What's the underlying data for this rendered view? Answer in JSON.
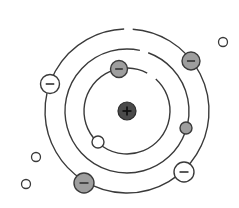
{
  "diagram": {
    "nucleus": {
      "sign": "+",
      "label": "nucleus",
      "color": "#4a4a4a"
    },
    "colors": {
      "stroke": "#3a3a3a",
      "electron_gray": "#9e9e9e",
      "electron_white": "#ffffff",
      "background": "#ffffff"
    },
    "orbits": [
      {
        "name": "inner-orbit",
        "level": 1
      },
      {
        "name": "middle-orbit",
        "level": 2
      },
      {
        "name": "outer-orbit",
        "level": 3
      }
    ],
    "electrons": [
      {
        "name": "electron-inner-top",
        "orbit": 1,
        "sign": "−",
        "style": "gray"
      },
      {
        "name": "electron-inner-bottom-left",
        "orbit": 1,
        "sign": "",
        "style": "white-small"
      },
      {
        "name": "electron-middle-right",
        "orbit": 2,
        "sign": "",
        "style": "gray-small"
      },
      {
        "name": "electron-outer-top-right",
        "orbit": 3,
        "sign": "−",
        "style": "gray"
      },
      {
        "name": "electron-outer-left",
        "orbit": 3,
        "sign": "−",
        "style": "white"
      },
      {
        "name": "electron-outer-bottom-right",
        "orbit": 3,
        "sign": "−",
        "style": "white"
      },
      {
        "name": "electron-outer-bottom-left",
        "orbit": 3,
        "sign": "−",
        "style": "gray"
      }
    ],
    "free_particles": [
      {
        "name": "free-particle-top-right"
      },
      {
        "name": "free-particle-left-upper"
      },
      {
        "name": "free-particle-left-lower"
      }
    ]
  }
}
